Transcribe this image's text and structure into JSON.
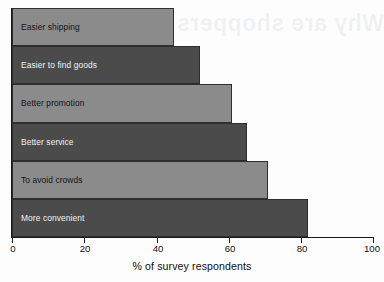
{
  "chart_data": {
    "type": "bar",
    "orientation": "horizontal",
    "title": "",
    "xlabel": "% of survey respondents",
    "ylabel": "",
    "xlim": [
      0,
      100
    ],
    "grid": false,
    "legend": null,
    "xticks": [
      "0",
      "20",
      "40",
      "60",
      "80",
      "100"
    ],
    "xtick_values": [
      0,
      20,
      40,
      60,
      80,
      100
    ],
    "categories": [
      "Easier shipping",
      "Easier to find goods",
      "Better promotion",
      "Better service",
      "To avoid crowds",
      "More convenient"
    ],
    "values": [
      45,
      52,
      61,
      65,
      71,
      82
    ],
    "bar_colors": [
      "#8b8b8b",
      "#4b4b4b",
      "#8b8b8b",
      "#4b4b4b",
      "#8b8b8b",
      "#4b4b4b"
    ],
    "bar_shades": [
      "light",
      "dark",
      "light",
      "dark",
      "light",
      "dark"
    ]
  },
  "colors": {
    "light_bar": "#8b8b8b",
    "dark_bar": "#4b4b4b",
    "bar_outline": "#2e2e2e",
    "axis": "#1a1a1a",
    "background": "#fdfdfd",
    "label_on_light": "#141414",
    "label_on_dark": "#f2f2f2"
  },
  "artifacts": {
    "bleed_through_text": "Why are shoppers"
  }
}
